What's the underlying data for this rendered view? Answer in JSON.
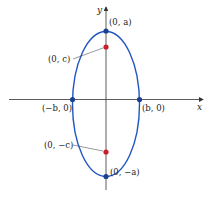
{
  "diagram": {
    "type": "ellipse-vertical-major-axis",
    "axes": {
      "x_label": "x",
      "y_label": "y"
    },
    "colors": {
      "ellipse": "#2255c4",
      "vertex": "#1c3f8f",
      "focus": "#c8202a",
      "axis": "#333333"
    },
    "points": {
      "top_vertex": "(0, a)",
      "bottom_vertex": "(0, −a)",
      "left_covertex": "(−b, 0)",
      "right_covertex": "(b, 0)",
      "top_focus": "(0, c)",
      "bottom_focus": "(0, −c)"
    }
  }
}
